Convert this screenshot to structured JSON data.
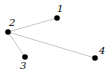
{
  "diagram": {
    "type": "graph",
    "directed": false,
    "colors": {
      "node": "#000000",
      "edge": "#c8c8c8",
      "label": "#000000",
      "background": "#ffffff"
    },
    "nodes": [
      {
        "id": "1",
        "label": "1",
        "x": 57,
        "y": 18,
        "label_x": 57,
        "label_y": 12
      },
      {
        "id": "2",
        "label": "2",
        "x": 8,
        "y": 32,
        "label_x": 9,
        "label_y": 26
      },
      {
        "id": "3",
        "label": "3",
        "x": 25,
        "y": 57,
        "label_x": 20,
        "label_y": 69
      },
      {
        "id": "4",
        "label": "4",
        "x": 95,
        "y": 58,
        "label_x": 99,
        "label_y": 54
      }
    ],
    "edges": [
      {
        "from": "2",
        "to": "1"
      },
      {
        "from": "2",
        "to": "3"
      },
      {
        "from": "2",
        "to": "4"
      }
    ]
  }
}
